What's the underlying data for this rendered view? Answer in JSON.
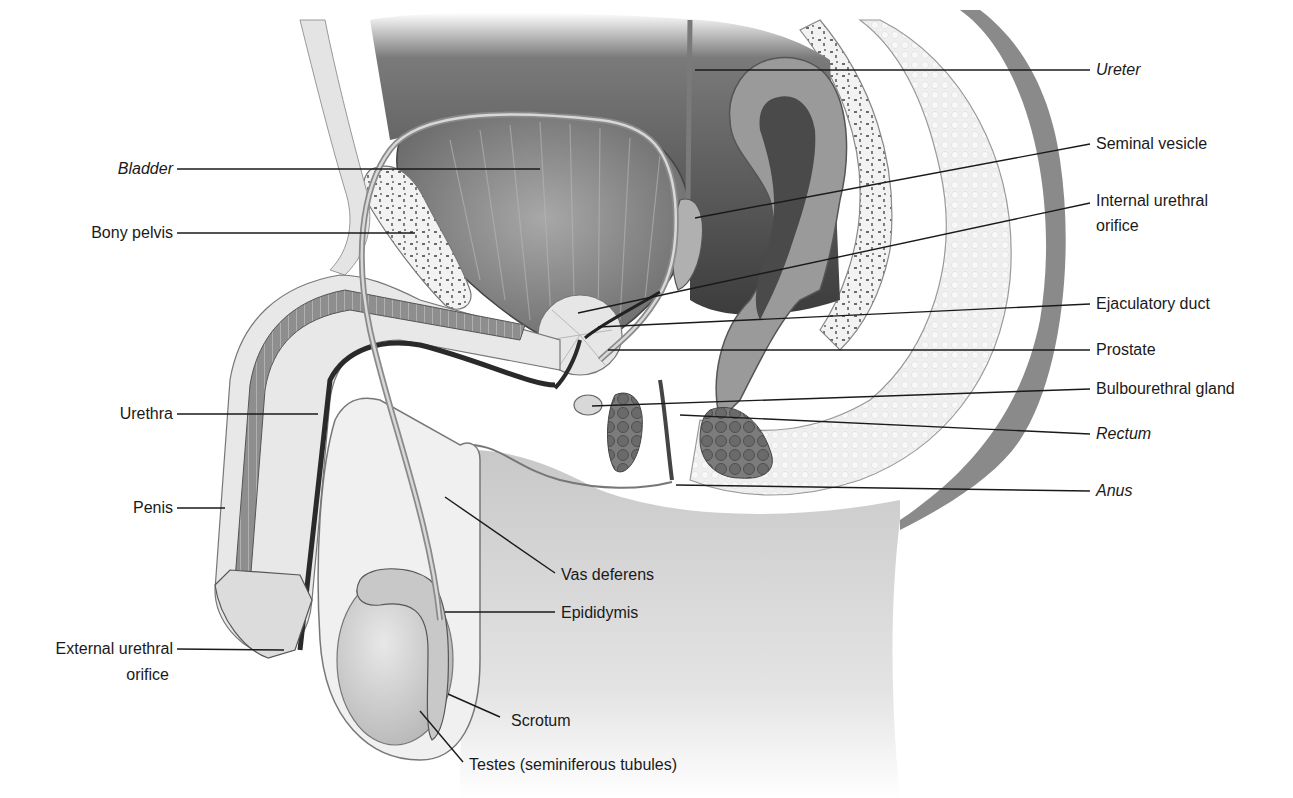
{
  "diagram": {
    "colors": {
      "background": "#ffffff",
      "label_text": "#1a1a1a",
      "leader_line": "#1a1a1a",
      "skin_dark": "#8a8a8a",
      "tissue_light": "#e6e6e6",
      "fat_tissue": "#f0f0f0",
      "muscle": "#9c9c9c",
      "cavity_dark": "#4a4a4a",
      "gland": "#707070"
    },
    "labels_left": [
      {
        "id": "bladder",
        "text": "Bladder",
        "italic": true
      },
      {
        "id": "bony-pelvis",
        "text": "Bony pelvis",
        "italic": false
      },
      {
        "id": "urethra",
        "text": "Urethra",
        "italic": false
      },
      {
        "id": "penis",
        "text": "Penis",
        "italic": false
      },
      {
        "id": "external-urethral-orifice",
        "text": "External urethral",
        "text2": "orifice",
        "italic": false
      }
    ],
    "labels_right": [
      {
        "id": "ureter",
        "text": "Ureter",
        "italic": true
      },
      {
        "id": "seminal-vesicle",
        "text": "Seminal vesicle",
        "italic": false
      },
      {
        "id": "internal-urethral-orifice",
        "text": "Internal urethral",
        "text2": "orifice",
        "italic": false
      },
      {
        "id": "ejaculatory-duct",
        "text": "Ejaculatory duct",
        "italic": false
      },
      {
        "id": "prostate",
        "text": "Prostate",
        "italic": false
      },
      {
        "id": "bulbourethral-gland",
        "text": "Bulbourethral gland",
        "italic": false
      },
      {
        "id": "rectum",
        "text": "Rectum",
        "italic": true
      },
      {
        "id": "anus",
        "text": "Anus",
        "italic": true
      }
    ],
    "labels_bottom": [
      {
        "id": "vas-deferens",
        "text": "Vas deferens",
        "italic": false
      },
      {
        "id": "epididymis",
        "text": "Epididymis",
        "italic": false
      },
      {
        "id": "scrotum",
        "text": "Scrotum",
        "italic": false
      },
      {
        "id": "testes",
        "text": "Testes (seminiferous tubules)",
        "italic": false
      }
    ]
  }
}
